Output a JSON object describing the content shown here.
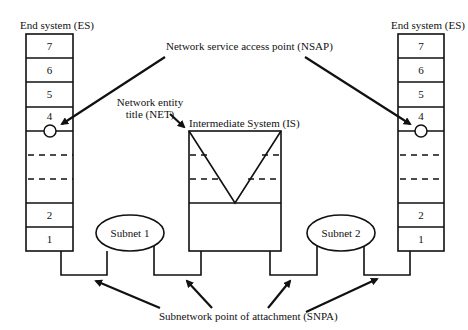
{
  "diagram": {
    "labels": {
      "es_left_title": "End system (ES)",
      "es_right_title": "End system (ES)",
      "nsap": "Network service access point (NSAP)",
      "net_line1": "Network entity",
      "net_line2": "title (NET)",
      "is_title": "Intermediate System (IS)",
      "subnet1": "Subnet 1",
      "subnet2": "Subnet 2",
      "snpa": "Subnetwork point of attachment (SNPA)"
    },
    "es_left": {
      "layers": {
        "l7": "7",
        "l6": "6",
        "l5": "5",
        "l4": "4",
        "l2": "2",
        "l1": "1"
      }
    },
    "es_right": {
      "layers": {
        "l7": "7",
        "l6": "6",
        "l5": "5",
        "l4": "4",
        "l2": "2",
        "l1": "1"
      }
    },
    "colors": {
      "stroke": "#111111",
      "background": "#ffffff"
    }
  }
}
